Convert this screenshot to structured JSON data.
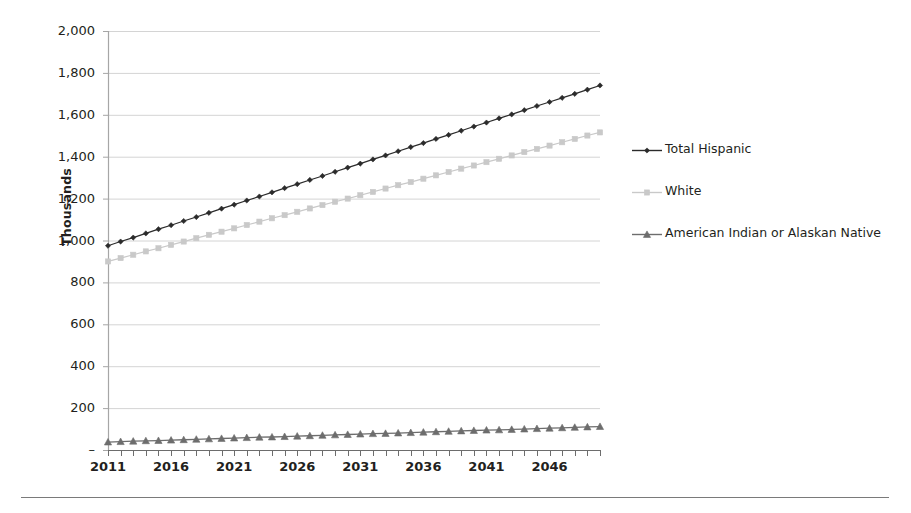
{
  "axis_title_y": "Thousands",
  "y_ticks": [
    "2,000",
    "1,800",
    "1,600",
    "1,400",
    "1,200",
    "1,000",
    "800",
    "600",
    "400",
    "200",
    "–"
  ],
  "x_ticks": [
    "2011",
    "2016",
    "2021",
    "2026",
    "2031",
    "2036",
    "2041",
    "2046"
  ],
  "legend": {
    "items": [
      {
        "label": "Total Hispanic",
        "color": "#2b2b2b",
        "marker": "diamond-marker"
      },
      {
        "label": "White",
        "color": "#c9c9c9",
        "marker": "square-marker"
      },
      {
        "label": "American Indian or Alaskan Native",
        "color": "#6d6d6d",
        "marker": "triangle-marker"
      }
    ]
  },
  "colors": {
    "total_hispanic": "#2b2b2b",
    "white": "#c9c9c9",
    "american_indian": "#6d6d6d",
    "gridline": "#d4d4d4",
    "axis": "#a6a6a6",
    "text": "#231f20",
    "footer_rule": "#7a7a7a"
  },
  "chart_data": {
    "type": "line",
    "title": "",
    "xlabel": "",
    "ylabel": "Thousands",
    "xlim": [
      2011,
      2050
    ],
    "ylim": [
      0,
      2000
    ],
    "ytick_values": [
      0,
      200,
      400,
      600,
      800,
      1000,
      1200,
      1400,
      1600,
      1800,
      2000
    ],
    "xtick_values": [
      2011,
      2016,
      2021,
      2026,
      2031,
      2036,
      2041,
      2046
    ],
    "grid": true,
    "legend_position": "right",
    "x": [
      2011,
      2012,
      2013,
      2014,
      2015,
      2016,
      2017,
      2018,
      2019,
      2020,
      2021,
      2022,
      2023,
      2024,
      2025,
      2026,
      2027,
      2028,
      2029,
      2030,
      2031,
      2032,
      2033,
      2034,
      2035,
      2036,
      2037,
      2038,
      2039,
      2040,
      2041,
      2042,
      2043,
      2044,
      2045,
      2046,
      2047,
      2048,
      2049,
      2050
    ],
    "series": [
      {
        "name": "Total Hispanic",
        "color": "#2b2b2b",
        "marker": "diamond",
        "values": [
          975,
          995,
          1014,
          1034,
          1054,
          1073,
          1093,
          1112,
          1132,
          1152,
          1171,
          1191,
          1210,
          1230,
          1250,
          1269,
          1289,
          1308,
          1328,
          1348,
          1367,
          1387,
          1406,
          1426,
          1446,
          1465,
          1485,
          1504,
          1524,
          1544,
          1563,
          1583,
          1602,
          1622,
          1642,
          1661,
          1681,
          1700,
          1720,
          1740
        ]
      },
      {
        "name": "White",
        "color": "#c9c9c9",
        "marker": "square",
        "values": [
          900,
          916,
          932,
          948,
          963,
          979,
          995,
          1011,
          1027,
          1042,
          1058,
          1074,
          1090,
          1106,
          1121,
          1137,
          1153,
          1169,
          1185,
          1200,
          1216,
          1232,
          1248,
          1264,
          1279,
          1295,
          1311,
          1327,
          1343,
          1358,
          1374,
          1390,
          1406,
          1422,
          1437,
          1453,
          1469,
          1485,
          1501,
          1516
        ]
      },
      {
        "name": "American Indian or Alaskan Native",
        "color": "#6d6d6d",
        "marker": "triangle",
        "values": [
          38,
          40,
          42,
          44,
          45,
          47,
          49,
          51,
          53,
          55,
          57,
          59,
          61,
          62,
          64,
          66,
          68,
          70,
          72,
          74,
          76,
          78,
          79,
          81,
          83,
          85,
          87,
          89,
          91,
          93,
          95,
          96,
          98,
          100,
          102,
          104,
          106,
          108,
          110,
          112
        ]
      }
    ]
  }
}
